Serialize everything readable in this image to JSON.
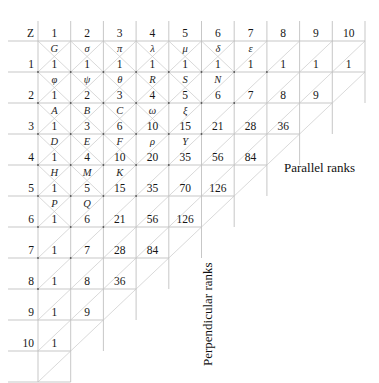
{
  "figure": {
    "title_corner": "Z",
    "grid": {
      "origin_x": 38,
      "origin_y": 41,
      "cell_w": 32.7,
      "cell_h": 31.0,
      "rows": 11
    },
    "row_headers": [
      "Z",
      "1",
      "2",
      "3",
      "4",
      "5",
      "6",
      "7",
      "8",
      "9",
      "10"
    ],
    "rows": [
      {
        "header": "Z",
        "numbers": [
          "1",
          "2",
          "3",
          "4",
          "5",
          "6",
          "7",
          "8",
          "9",
          "10"
        ],
        "labels": [
          "G",
          "σ",
          "π",
          "λ",
          "μ",
          "δ",
          "ε",
          "",
          "",
          ""
        ]
      },
      {
        "header": "1",
        "numbers": [
          "1",
          "1",
          "1",
          "1",
          "1",
          "1",
          "1",
          "1",
          "1",
          "1"
        ],
        "labels": [
          "φ",
          "ψ",
          "θ",
          "R",
          "S",
          "N",
          "",
          "",
          "",
          ""
        ]
      },
      {
        "header": "2",
        "numbers": [
          "1",
          "2",
          "3",
          "4",
          "5",
          "6",
          "7",
          "8",
          "9"
        ],
        "labels": [
          "A",
          "B",
          "C",
          "ω",
          "ξ",
          "",
          "",
          "",
          ""
        ]
      },
      {
        "header": "3",
        "numbers": [
          "1",
          "3",
          "6",
          "10",
          "15",
          "21",
          "28",
          "36"
        ],
        "labels": [
          "D",
          "E",
          "F",
          "ρ",
          "Y",
          "",
          "",
          ""
        ]
      },
      {
        "header": "4",
        "numbers": [
          "1",
          "4",
          "10",
          "20",
          "35",
          "56",
          "84"
        ],
        "labels": [
          "H",
          "M",
          "K",
          "",
          "",
          "",
          ""
        ]
      },
      {
        "header": "5",
        "numbers": [
          "1",
          "5",
          "15",
          "35",
          "70",
          "126"
        ],
        "labels": [
          "P",
          "Q",
          "",
          "",
          "",
          ""
        ]
      },
      {
        "header": "6",
        "numbers": [
          "1",
          "6",
          "21",
          "56",
          "126"
        ],
        "labels": [
          "",
          "",
          "",
          "",
          ""
        ]
      },
      {
        "header": "7",
        "numbers": [
          "1",
          "7",
          "28",
          "84"
        ],
        "labels": [
          "",
          "",
          "",
          ""
        ]
      },
      {
        "header": "8",
        "numbers": [
          "1",
          "8",
          "36"
        ],
        "labels": [
          "",
          "",
          ""
        ]
      },
      {
        "header": "9",
        "numbers": [
          "1",
          "9"
        ],
        "labels": [
          "",
          ""
        ]
      },
      {
        "header": "10",
        "numbers": [
          "1"
        ],
        "labels": [
          ""
        ]
      }
    ],
    "annotations": {
      "parallel_ranks": "Parallel ranks",
      "perpendicular_ranks": "Perpendicular ranks",
      "parallel_x": 284,
      "parallel_y": 160,
      "perpendicular_x": 200,
      "perpendicular_y": 366
    },
    "colors": {
      "grid_line": "#b9b9b9",
      "diagonal_line": "#c9c9c9",
      "text": "#161616",
      "background": "#ffffff"
    }
  }
}
